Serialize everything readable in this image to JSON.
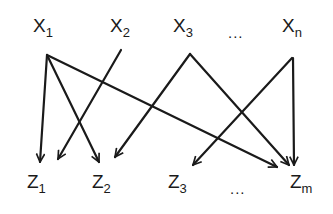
{
  "diagram": {
    "type": "bipartite-directed-graph",
    "stroke_color": "#1a1a1a",
    "sources": [
      {
        "id": "x1",
        "base": "X",
        "sub": "1"
      },
      {
        "id": "x2",
        "base": "X",
        "sub": "2"
      },
      {
        "id": "x3",
        "base": "X",
        "sub": "3"
      },
      {
        "id": "xn",
        "base": "X",
        "sub": "n"
      }
    ],
    "targets": [
      {
        "id": "z1",
        "base": "Z",
        "sub": "1"
      },
      {
        "id": "z2",
        "base": "Z",
        "sub": "2"
      },
      {
        "id": "z3",
        "base": "Z",
        "sub": "3"
      },
      {
        "id": "zm",
        "base": "Z",
        "sub": "m"
      }
    ],
    "top_ellipsis": "...",
    "bottom_ellipsis": "...",
    "edges": [
      {
        "from": "x1",
        "to": "z1"
      },
      {
        "from": "x1",
        "to": "z2"
      },
      {
        "from": "x1",
        "to": "zm"
      },
      {
        "from": "x2",
        "to": "z1"
      },
      {
        "from": "x3",
        "to": "z2"
      },
      {
        "from": "x3",
        "to": "zm"
      },
      {
        "from": "xn",
        "to": "z3"
      },
      {
        "from": "xn",
        "to": "zm"
      }
    ]
  }
}
